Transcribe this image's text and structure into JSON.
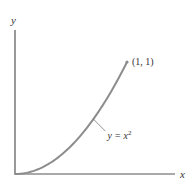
{
  "chart_data": {
    "type": "line",
    "title": "",
    "xlabel": "x",
    "ylabel": "y",
    "xlim": [
      0,
      1.1
    ],
    "ylim": [
      0,
      1.1
    ],
    "grid": false,
    "series": [
      {
        "name": "y = x^2",
        "label_base": "y = x",
        "label_exponent": "2",
        "function": "x^2",
        "x": [
          0,
          0.1,
          0.2,
          0.3,
          0.4,
          0.5,
          0.6,
          0.7,
          0.8,
          0.9,
          1.0
        ],
        "y": [
          0,
          0.01,
          0.04,
          0.09,
          0.16,
          0.25,
          0.36,
          0.49,
          0.64,
          0.81,
          1.0
        ],
        "color": "#8c8c8c"
      }
    ],
    "annotations": [
      {
        "text": "(1, 1)",
        "x": 1,
        "y": 1,
        "type": "point-label"
      },
      {
        "text": "y = x^2",
        "type": "curve-label",
        "points_to_x": 0.7,
        "points_to_y": 0.49
      }
    ],
    "axis_color": "#555555"
  }
}
